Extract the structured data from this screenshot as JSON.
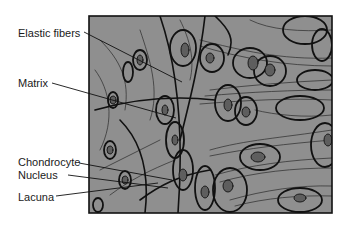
{
  "diagram": {
    "background_color": "#ffffff",
    "tissue_fill": "#8f8f8f",
    "stroke_color": "#111111",
    "labels": [
      {
        "id": "elastic-fibers",
        "text": "Elastic fibers"
      },
      {
        "id": "matrix",
        "text": "Matrix"
      },
      {
        "id": "chondrocyte",
        "text": "Chondrocyte"
      },
      {
        "id": "nucleus",
        "text": "Nucleus"
      },
      {
        "id": "lacuna",
        "text": "Lacuna"
      }
    ]
  }
}
